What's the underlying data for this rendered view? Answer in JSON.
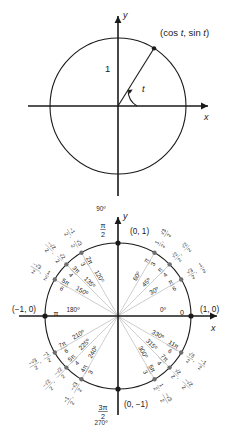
{
  "figure": {
    "colors": {
      "ink": "#1a1a1a",
      "spoke_gray": "#b9b9b9",
      "radian_gray": "#8d8d8d",
      "point_gray": "#6f6f6f",
      "background": "#ffffff"
    }
  },
  "top_diagram": {
    "name": "unit-circle-definition",
    "x_axis_label": "x",
    "y_axis_label": "y",
    "point_label": "(cos t, sin t)",
    "point_label_parts": {
      "open": "(cos ",
      "var1": "t",
      "mid": ", sin ",
      "var2": "t",
      "close": ")"
    },
    "radius_label": "1",
    "angle_label": "t",
    "angle_degrees": 58,
    "radius_px": 68,
    "center": {
      "x": 118,
      "y": 106
    }
  },
  "bottom_diagram": {
    "name": "unit-circle-chart",
    "x_axis_label": "x",
    "y_axis_label": "y",
    "center": {
      "x": 118,
      "y": 116
    },
    "radius_px": 73,
    "axis_points": [
      {
        "label": "(0, 1)",
        "position": "top"
      },
      {
        "label": "(1, 0)",
        "position": "right"
      },
      {
        "label": "(0, −1)",
        "position": "bottom"
      },
      {
        "label": "(−1, 0)",
        "position": "left"
      }
    ],
    "angles": [
      {
        "deg": "0º",
        "deg_value": 0,
        "rad": "0",
        "rad_num": "0",
        "rad_den": "",
        "cos_num": "1",
        "cos_den": "",
        "sin_num": "0",
        "sin_den": "",
        "axis": true
      },
      {
        "deg": "30º",
        "deg_value": 30,
        "rad": "π/6",
        "rad_num": "π",
        "rad_den": "6",
        "cos_num": "√3",
        "cos_den": "2",
        "sin_num": "1",
        "sin_den": "2",
        "axis": false
      },
      {
        "deg": "45º",
        "deg_value": 45,
        "rad": "π/4",
        "rad_num": "π",
        "rad_den": "4",
        "cos_num": "√2",
        "cos_den": "2",
        "sin_num": "√2",
        "sin_den": "2",
        "axis": false
      },
      {
        "deg": "60º",
        "deg_value": 60,
        "rad": "π/3",
        "rad_num": "π",
        "rad_den": "3",
        "cos_num": "1",
        "cos_den": "2",
        "sin_num": "√3",
        "sin_den": "2",
        "axis": false
      },
      {
        "deg": "90º",
        "deg_value": 90,
        "rad": "π/2",
        "rad_num": "π",
        "rad_den": "2",
        "cos_num": "0",
        "cos_den": "",
        "sin_num": "1",
        "sin_den": "",
        "axis": true
      },
      {
        "deg": "120º",
        "deg_value": 120,
        "rad": "2π/3",
        "rad_num": "2π",
        "rad_den": "3",
        "cos_num": "−1",
        "cos_den": "2",
        "sin_num": "√3",
        "sin_den": "2",
        "axis": false
      },
      {
        "deg": "135º",
        "deg_value": 135,
        "rad": "3π/4",
        "rad_num": "3π",
        "rad_den": "4",
        "cos_num": "−√2",
        "cos_den": "2",
        "sin_num": "√2",
        "sin_den": "2",
        "axis": false
      },
      {
        "deg": "150º",
        "deg_value": 150,
        "rad": "5π/6",
        "rad_num": "5π",
        "rad_den": "6",
        "cos_num": "−√3",
        "cos_den": "2",
        "sin_num": "1",
        "sin_den": "2",
        "axis": false
      },
      {
        "deg": "180º",
        "deg_value": 180,
        "rad": "π",
        "rad_num": "π",
        "rad_den": "",
        "cos_num": "−1",
        "cos_den": "",
        "sin_num": "0",
        "sin_den": "",
        "axis": true
      },
      {
        "deg": "210º",
        "deg_value": 210,
        "rad": "7π/6",
        "rad_num": "7π",
        "rad_den": "6",
        "cos_num": "−√3",
        "cos_den": "2",
        "sin_num": "−1",
        "sin_den": "2",
        "axis": false
      },
      {
        "deg": "225º",
        "deg_value": 225,
        "rad": "5π/4",
        "rad_num": "5π",
        "rad_den": "4",
        "cos_num": "−√2",
        "cos_den": "2",
        "sin_num": "−√2",
        "sin_den": "2",
        "axis": false
      },
      {
        "deg": "240º",
        "deg_value": 240,
        "rad": "4π/3",
        "rad_num": "4π",
        "rad_den": "3",
        "cos_num": "−1",
        "cos_den": "2",
        "sin_num": "−√3",
        "sin_den": "2",
        "axis": false
      },
      {
        "deg": "270º",
        "deg_value": 270,
        "rad": "3π/2",
        "rad_num": "3π",
        "rad_den": "2",
        "cos_num": "0",
        "cos_den": "",
        "sin_num": "−1",
        "sin_den": "",
        "axis": true
      },
      {
        "deg": "300º",
        "deg_value": 300,
        "rad": "5π/3",
        "rad_num": "5π",
        "rad_den": "3",
        "cos_num": "1",
        "cos_den": "2",
        "sin_num": "−√3",
        "sin_den": "2",
        "axis": false
      },
      {
        "deg": "315º",
        "deg_value": 315,
        "rad": "7π/4",
        "rad_num": "7π",
        "rad_den": "4",
        "cos_num": "√2",
        "cos_den": "2",
        "sin_num": "−√2",
        "sin_den": "2",
        "axis": false
      },
      {
        "deg": "330º",
        "deg_value": 330,
        "rad": "11π/6",
        "rad_num": "11π",
        "rad_den": "6",
        "cos_num": "√3",
        "cos_den": "2",
        "sin_num": "−1",
        "sin_den": "2",
        "axis": false
      }
    ]
  }
}
